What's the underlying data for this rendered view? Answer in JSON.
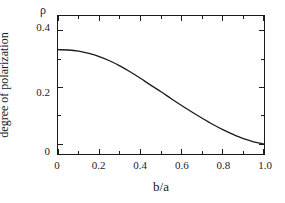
{
  "chart_data": {
    "type": "line",
    "title": "",
    "subtitle": "",
    "xlabel": "b/a",
    "ylabel": "degree of polarization",
    "ylabel_symbol": "ρ",
    "xlim": [
      0,
      1.0
    ],
    "ylim": [
      -0.035,
      0.452
    ],
    "grid": false,
    "legend": null,
    "xticks": [
      0,
      0.2,
      0.4,
      0.6,
      0.8,
      1.0
    ],
    "xtick_labels": [
      "0",
      "0.2",
      "0.4",
      "0.6",
      "0.8",
      "1.0"
    ],
    "x_minor_ticks": [
      0.1,
      0.3,
      0.5,
      0.7,
      0.9
    ],
    "yticks": [
      0,
      0.2,
      0.4
    ],
    "ytick_labels": [
      "0",
      "0.2",
      "0.4"
    ],
    "y_minor_ticks": [
      0.1,
      0.3
    ],
    "tick_direction": "in",
    "line_color": "#1a1a1a",
    "axis_color": "#1a1a1a",
    "background_color": "#ffffff",
    "series": [
      {
        "name": "degree of polarization",
        "x": [
          0.0,
          0.05,
          0.1,
          0.15,
          0.2,
          0.25,
          0.3,
          0.35,
          0.4,
          0.45,
          0.5,
          0.55,
          0.6,
          0.65,
          0.7,
          0.75,
          0.8,
          0.85,
          0.9,
          0.95,
          1.0
        ],
        "values": [
          0.333,
          0.332,
          0.328,
          0.32,
          0.309,
          0.294,
          0.276,
          0.255,
          0.232,
          0.208,
          0.185,
          0.16,
          0.136,
          0.113,
          0.091,
          0.07,
          0.051,
          0.034,
          0.019,
          0.008,
          0.0
        ]
      }
    ],
    "annotations": []
  },
  "axes": {
    "x_labels": [
      "0",
      "0.2",
      "0.4",
      "0.6",
      "0.8",
      "1.0"
    ],
    "y_labels": [
      "0.4",
      "0.2",
      "0"
    ],
    "x_title": "b/a",
    "y_title": "degree of polarization",
    "y_symbol": "ρ"
  }
}
